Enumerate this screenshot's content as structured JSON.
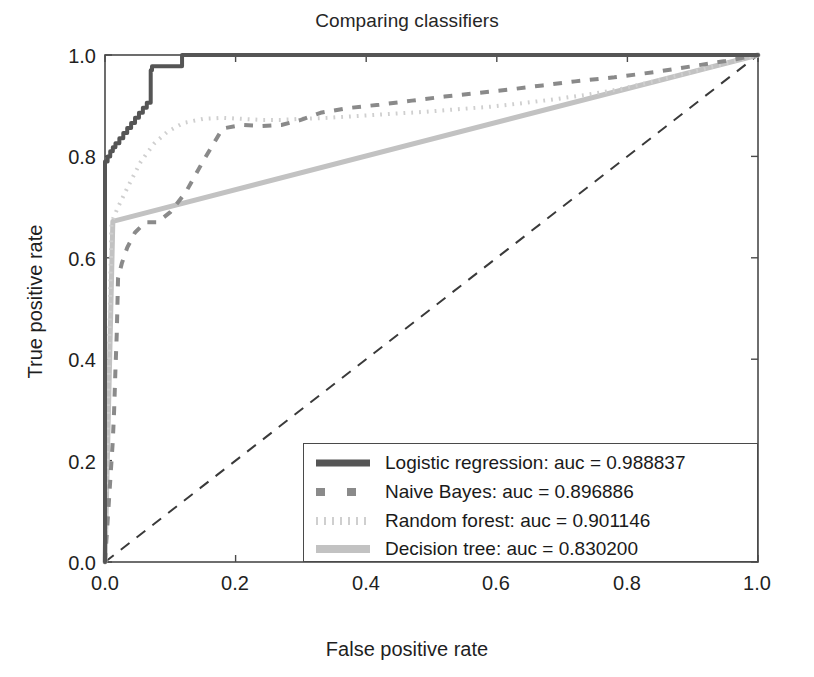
{
  "chart_data": {
    "type": "line",
    "title": "Comparing classifiers",
    "xlabel": "False positive rate",
    "ylabel": "True positive rate",
    "xlim": [
      0.0,
      1.0
    ],
    "ylim": [
      0.0,
      1.0
    ],
    "grid": false,
    "legend_position": "lower right",
    "xticks": [
      "0.0",
      "0.2",
      "0.4",
      "0.6",
      "0.8",
      "1.0"
    ],
    "yticks": [
      "0.0",
      "0.2",
      "0.4",
      "0.6",
      "0.8",
      "1.0"
    ],
    "xtick_values": [
      0.0,
      0.2,
      0.4,
      0.6,
      0.8,
      1.0
    ],
    "ytick_values": [
      0.0,
      0.2,
      0.4,
      0.6,
      0.8,
      1.0
    ],
    "series": [
      {
        "name": "Logistic regression",
        "auc": "0.988837",
        "legend_label": "Logistic regression: auc = 0.988837",
        "color": "#555555",
        "linestyle": "solid",
        "linewidth": 4,
        "x": [
          0.0,
          0.0,
          0.004,
          0.004,
          0.008,
          0.008,
          0.012,
          0.012,
          0.016,
          0.016,
          0.022,
          0.022,
          0.028,
          0.028,
          0.034,
          0.034,
          0.04,
          0.04,
          0.046,
          0.046,
          0.052,
          0.052,
          0.058,
          0.058,
          0.064,
          0.064,
          0.07,
          0.07,
          0.072,
          0.072,
          0.118,
          0.118,
          1.0
        ],
        "y": [
          0.0,
          0.79,
          0.79,
          0.8,
          0.8,
          0.81,
          0.81,
          0.818,
          0.818,
          0.826,
          0.826,
          0.836,
          0.836,
          0.846,
          0.846,
          0.856,
          0.856,
          0.866,
          0.866,
          0.876,
          0.876,
          0.886,
          0.886,
          0.896,
          0.896,
          0.906,
          0.906,
          0.97,
          0.97,
          0.978,
          0.978,
          1.0,
          1.0
        ]
      },
      {
        "name": "Naive Bayes",
        "auc": "0.896886",
        "legend_label": "Naive Bayes: auc = 0.896886",
        "color": "#8a8a8a",
        "linestyle": "dashed",
        "linewidth": 4,
        "x": [
          0.0,
          0.006,
          0.008,
          0.01,
          0.012,
          0.014,
          0.016,
          0.018,
          0.02,
          0.026,
          0.034,
          0.046,
          0.062,
          0.08,
          0.1,
          0.124,
          0.15,
          0.18,
          0.21,
          0.24,
          0.27,
          0.3,
          0.33,
          0.37,
          0.42,
          0.47,
          0.52,
          0.57,
          0.62,
          0.67,
          0.72,
          0.78,
          0.84,
          0.9,
          0.95,
          1.0
        ],
        "y": [
          0.0,
          0.12,
          0.16,
          0.2,
          0.24,
          0.3,
          0.38,
          0.45,
          0.56,
          0.59,
          0.62,
          0.65,
          0.67,
          0.67,
          0.69,
          0.73,
          0.79,
          0.855,
          0.862,
          0.86,
          0.862,
          0.872,
          0.886,
          0.895,
          0.902,
          0.91,
          0.918,
          0.925,
          0.932,
          0.94,
          0.948,
          0.956,
          0.966,
          0.978,
          0.988,
          1.0
        ]
      },
      {
        "name": "Random forest",
        "auc": "0.901146",
        "legend_label": "Random forest: auc = 0.901146",
        "color": "#cfcfcf",
        "linestyle": "dotted",
        "linewidth": 4,
        "x": [
          0.0,
          0.01,
          0.02,
          0.035,
          0.055,
          0.075,
          0.095,
          0.12,
          0.15,
          0.18,
          0.21,
          0.24,
          0.27,
          0.3,
          0.34,
          0.39,
          0.44,
          0.49,
          0.54,
          0.59,
          0.64,
          0.69,
          0.74,
          0.79,
          0.84,
          0.89,
          0.94,
          1.0
        ],
        "y": [
          0.0,
          0.67,
          0.7,
          0.74,
          0.79,
          0.825,
          0.848,
          0.866,
          0.874,
          0.876,
          0.874,
          0.872,
          0.872,
          0.874,
          0.876,
          0.88,
          0.884,
          0.888,
          0.893,
          0.898,
          0.905,
          0.913,
          0.922,
          0.933,
          0.948,
          0.964,
          0.98,
          1.0
        ]
      },
      {
        "name": "Decision tree",
        "auc": "0.830200",
        "legend_label": "Decision tree: auc = 0.830200",
        "color": "#c2c2c2",
        "linestyle": "solid",
        "linewidth": 5,
        "x": [
          0.0,
          0.012,
          1.0
        ],
        "y": [
          0.0,
          0.672,
          1.0
        ]
      }
    ],
    "reference_line": {
      "name": "chance-diagonal",
      "x": [
        0.0,
        1.0
      ],
      "y": [
        0.0,
        1.0
      ],
      "color": "#3a3a3a",
      "linestyle": "dashed",
      "linewidth": 2
    }
  },
  "legend": {
    "entries": [
      "Logistic regression: auc = 0.988837",
      "Naive Bayes: auc = 0.896886",
      "Random forest: auc = 0.901146",
      "Decision tree: auc = 0.830200"
    ]
  },
  "ticks": {
    "x": [
      "0.0",
      "0.2",
      "0.4",
      "0.6",
      "0.8",
      "1.0"
    ],
    "y": [
      "0.0",
      "0.2",
      "0.4",
      "0.6",
      "0.8",
      "1.0"
    ]
  }
}
